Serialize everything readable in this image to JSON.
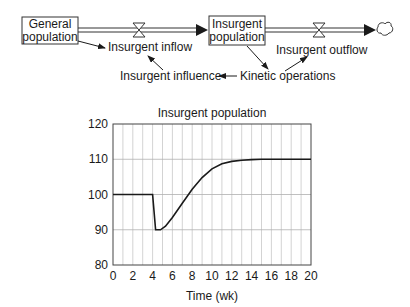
{
  "diagram": {
    "stocks": [
      {
        "id": "general_population",
        "line1": "General",
        "line2": "population"
      },
      {
        "id": "insurgent_population",
        "line1": "Insurgent",
        "line2": "population"
      }
    ],
    "flows": [
      {
        "id": "insurgent_inflow",
        "label": "Insurgent inflow"
      },
      {
        "id": "insurgent_outflow",
        "label": "Insurgent outflow"
      }
    ],
    "auxiliaries": [
      {
        "id": "insurgent_influence",
        "label": "Insurgent influence"
      },
      {
        "id": "kinetic_operations",
        "label": "Kinetic operations"
      }
    ],
    "sink_icon": "cloud-icon",
    "valve_icon": "hourglass-valve-icon"
  },
  "chart_data": {
    "type": "line",
    "title": "Insurgent population",
    "xlabel": "Time (wk)",
    "ylabel": "",
    "xlim": [
      0,
      20
    ],
    "ylim": [
      80,
      120
    ],
    "xticks": [
      "0",
      "2",
      "4",
      "6",
      "8",
      "10",
      "12",
      "14",
      "16",
      "18",
      "20"
    ],
    "yticks": [
      "80",
      "90",
      "100",
      "110",
      "120"
    ],
    "grid": true,
    "legend": null,
    "series": [
      {
        "name": "Insurgent population",
        "x": [
          0,
          4,
          4.0,
          4.3,
          4.8,
          5.3,
          6,
          7,
          8,
          9,
          10,
          11,
          12,
          13,
          14,
          15,
          16,
          18,
          20
        ],
        "y": [
          100,
          100,
          100,
          90,
          90,
          91,
          93.5,
          97.5,
          101.5,
          104.8,
          107.3,
          108.7,
          109.4,
          109.7,
          109.9,
          110,
          110,
          110,
          110
        ]
      }
    ]
  }
}
